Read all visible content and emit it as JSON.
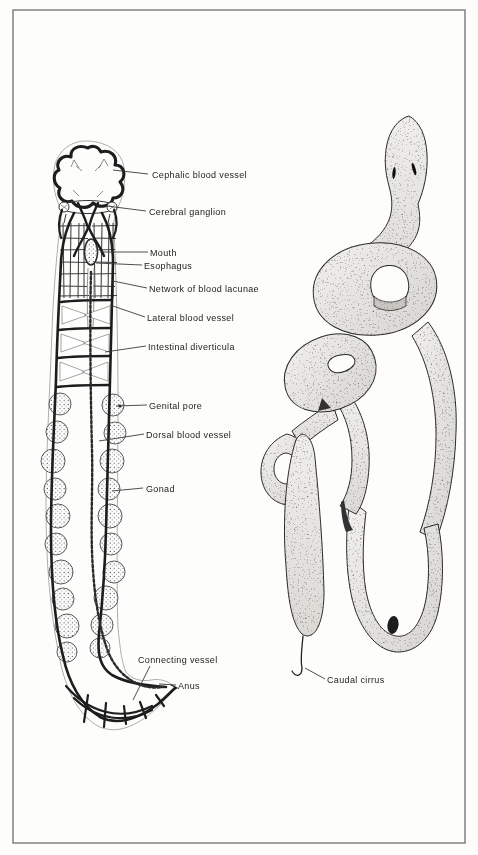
{
  "plate": {
    "background_color": "#fdfdfb",
    "frame_color": "#6e6e6e",
    "ink_color": "#1f1f1f",
    "worm_fill_color": "#e9e7e3"
  },
  "labels": [
    {
      "id": "cephalic-blood-vessel",
      "text": "Cephalic blood vessel"
    },
    {
      "id": "cerebral-ganglion",
      "text": "Cerebral ganglion"
    },
    {
      "id": "mouth",
      "text": "Mouth"
    },
    {
      "id": "esophagus",
      "text": "Esophagus"
    },
    {
      "id": "network-of-blood-lacunae",
      "text": "Network of blood lacunae"
    },
    {
      "id": "lateral-blood-vessel",
      "text": "Lateral blood vessel"
    },
    {
      "id": "intestinal-diverticula",
      "text": "Intestinal diverticula"
    },
    {
      "id": "genital-pore",
      "text": "Genital pore"
    },
    {
      "id": "dorsal-blood-vessel",
      "text": "Dorsal blood vessel"
    },
    {
      "id": "gonad",
      "text": "Gonad"
    },
    {
      "id": "connecting-vessel",
      "text": "Connecting vessel"
    },
    {
      "id": "anus",
      "text": "Anus"
    },
    {
      "id": "caudal-cirrus",
      "text": "Caudal cirrus"
    }
  ]
}
